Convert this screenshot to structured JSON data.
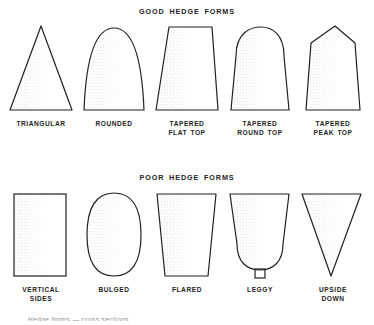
{
  "figure": {
    "title_good": "GOOD HEDGE FORMS",
    "title_poor": "POOR HEDGE FORMS",
    "ink_color": "#231f20",
    "shade_color": "#9a9a9a",
    "background_color": "#ffffff",
    "footer_partial": "Hedge forms — cross sections"
  },
  "good_forms": {
    "items": [
      {
        "id": "triangular",
        "label_line1": "TRIANGULAR",
        "label_line2": "",
        "shape": "triangle",
        "description": "Narrow pointed apex, wide base, straight sloping sides"
      },
      {
        "id": "rounded",
        "label_line1": "ROUNDED",
        "label_line2": "",
        "shape": "parabolic-dome",
        "description": "Dome / parabola top with sides curving out to a wide base"
      },
      {
        "id": "tapered-flat-top",
        "label_line1": "TAPERED",
        "label_line2": "FLAT TOP",
        "shape": "trapezoid-narrow-top",
        "description": "Flat top narrower than the base, straight tapering sides"
      },
      {
        "id": "tapered-round-top",
        "label_line1": "TAPERED",
        "label_line2": "ROUND TOP",
        "shape": "tapered-dome",
        "description": "Tapered sides with a semicircular rounded crown"
      },
      {
        "id": "tapered-peak-top",
        "label_line1": "TAPERED",
        "label_line2": "PEAK TOP",
        "shape": "tapered-peak",
        "description": "Tapered sides rising to a shallow peaked apex"
      }
    ]
  },
  "poor_forms": {
    "items": [
      {
        "id": "vertical-sides",
        "label_line1": "VERTICAL",
        "label_line2": "SIDES",
        "shape": "rectangle",
        "description": "Upright rectangle, sides perfectly vertical, flat top"
      },
      {
        "id": "bulged",
        "label_line1": "BULGED",
        "label_line2": "",
        "shape": "oval",
        "description": "Barrel / oval outline bulging out at mid height"
      },
      {
        "id": "flared",
        "label_line1": "FLARED",
        "label_line2": "",
        "shape": "inverted-trapezoid",
        "description": "Wide flat top narrowing to a smaller base"
      },
      {
        "id": "leggy",
        "label_line1": "LEGGY",
        "label_line2": "",
        "shape": "u-bowl-on-stem",
        "description": "Wide top tapering to a rounded bottom raised on a bare stem"
      },
      {
        "id": "upside-down",
        "label_line1": "UPSIDE",
        "label_line2": "DOWN",
        "shape": "inverted-triangle",
        "description": "Inverted triangle, wide flat top converging to a point"
      }
    ]
  }
}
